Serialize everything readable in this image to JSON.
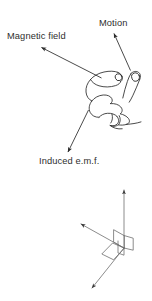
{
  "figure": {
    "background_color": "#ffffff",
    "stroke_color": "#2b2b2b",
    "axes_stroke_color": "#6b6b6b",
    "width": 152,
    "height": 301
  },
  "hand_diagram": {
    "name": "right-hand-rule-hand",
    "description": "Line drawing of a right hand with thumb, first finger and second finger mutually perpendicular",
    "labels": [
      {
        "id": "magnetic_field",
        "text": "Magnetic field",
        "arrow_direction": "up-left",
        "points_to": "first-finger"
      },
      {
        "id": "motion",
        "text": "Motion",
        "arrow_direction": "up-right",
        "points_to": "thumb"
      },
      {
        "id": "induced_emf",
        "text": "Induced e.m.f.",
        "arrow_direction": "down-left",
        "points_to": "second-finger"
      }
    ]
  },
  "axes_diagram": {
    "name": "orthogonal-axes",
    "description": "Three mutually perpendicular arrows with right-angle markers at the origin",
    "arrows": [
      {
        "id": "axis_up",
        "direction": "up",
        "label": ""
      },
      {
        "id": "axis_up_left",
        "direction": "up-left",
        "label": ""
      },
      {
        "id": "axis_down_left",
        "direction": "down-left",
        "label": ""
      }
    ],
    "right_angle_markers": 3
  }
}
